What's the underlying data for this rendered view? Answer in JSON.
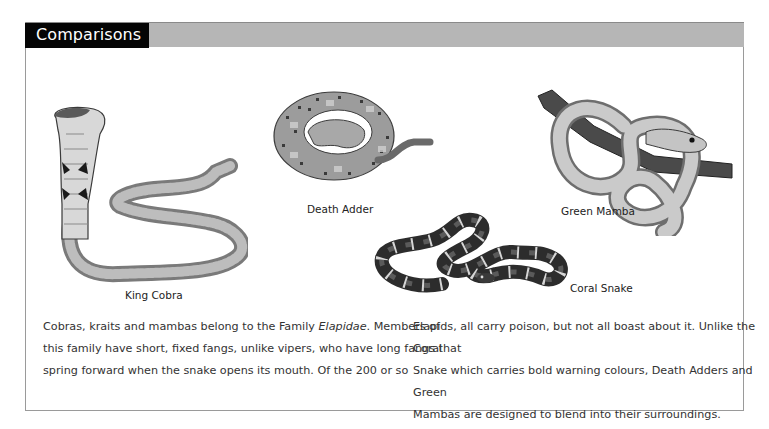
{
  "section": {
    "title": "Comparisons"
  },
  "colors": {
    "title_tab_bg": "#050505",
    "header_band_bg": "#b6b6b6",
    "border": "#9a9a9a"
  },
  "illustrations": [
    {
      "id": "king-cobra",
      "caption": "King Cobra",
      "icon": "king-cobra-illustration"
    },
    {
      "id": "death-adder",
      "caption": "Death Adder",
      "icon": "death-adder-illustration"
    },
    {
      "id": "green-mamba",
      "caption": "Green Mamba",
      "icon": "green-mamba-illustration"
    },
    {
      "id": "coral-snake",
      "caption": "Coral Snake",
      "icon": "coral-snake-illustration"
    }
  ],
  "body": {
    "left": {
      "line1_pre": "Cobras, kraits and mambas belong to the Family ",
      "line1_em": "Elapidae",
      "line1_post": ". Members of",
      "line2": "this family have short, fixed fangs, unlike vipers, who have long fangs that",
      "line3": "spring forward when the snake opens its mouth. Of the 200 or so"
    },
    "right": {
      "line1": "Elapids, all carry poison, but not all boast about it. Unlike the Coral",
      "line2": "Snake which carries bold warning colours, Death Adders and Green",
      "line3": "Mambas are designed to blend into their surroundings."
    }
  }
}
